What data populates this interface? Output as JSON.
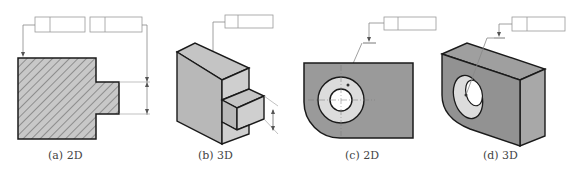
{
  "figure": {
    "panels": [
      {
        "id": "a",
        "caption": "(a) 2D",
        "view": "2D",
        "description": "hatched stepped profile with two feature control frames and dimension arrows"
      },
      {
        "id": "b",
        "caption": "(b) 3D",
        "view": "3D",
        "description": "isometric stepped block with one feature control frame"
      },
      {
        "id": "c",
        "caption": "(c) 2D",
        "view": "2D",
        "description": "plate with rounded corner and bored hole, one feature control frame"
      },
      {
        "id": "d",
        "caption": "(d) 3D",
        "view": "3D",
        "description": "isometric plate with bored hole, one feature control frame"
      }
    ]
  },
  "colors": {
    "fill_dark": "#9a9a9a",
    "fill_mid": "#bdbdbd",
    "fill_light": "#dcdcdc",
    "stroke": "#1a1a1a",
    "leader": "#8a8a8a"
  }
}
